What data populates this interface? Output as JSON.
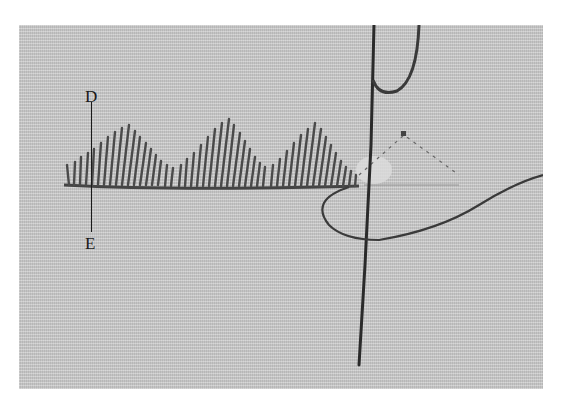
{
  "figure": {
    "labels": {
      "top": "D",
      "bottom": "E"
    },
    "colors": {
      "fabric": "#c9c9c9",
      "thread": "#3a3a3a",
      "needle": "#2a2a2a",
      "background": "#ffffff"
    }
  }
}
